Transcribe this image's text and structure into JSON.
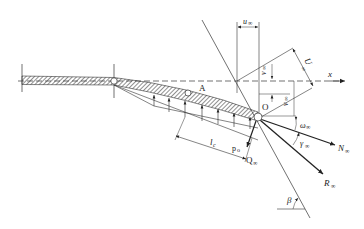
{
  "figure": {
    "type": "hydrofoil/flap force diagram",
    "colors": {
      "line": "#222222",
      "hatch": "#333333",
      "background": "#ffffff"
    },
    "labels": {
      "x_axis": "x",
      "point_A": "A",
      "point_O": "O",
      "u_inf": "u",
      "u_inf_sub": "∞",
      "U_inf": "U",
      "U_inf_sub": "∞",
      "v_inf_upper": "v",
      "v_inf_upper_sub": "∞",
      "v_inf_lower": "v",
      "v_inf_lower_sub": "∞",
      "omega_inf": "ω",
      "omega_inf_sub": "∞",
      "gamma_inf": "γ",
      "gamma_inf_sub": "∞",
      "N_inf": "N",
      "N_inf_sub": "∞",
      "R_inf": "R",
      "R_inf_sub": "∞",
      "Q_inf": "Q",
      "Q_inf_sub": "∞",
      "l_c": "l",
      "l_c_sub": "c",
      "p_o": "p",
      "p_o_sub": "o",
      "beta": "β"
    }
  }
}
